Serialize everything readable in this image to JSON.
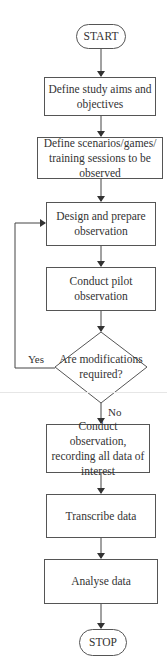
{
  "flowchart": {
    "start": "START",
    "steps": [
      "Define study aims and objectives",
      "Define scenarios/games/ training sessions to be observed",
      "Design and prepare observation",
      "Conduct pilot observation"
    ],
    "decision": "Are modifications required?",
    "decision_yes": "Yes",
    "decision_no": "No",
    "steps_after": [
      "Conduct observation, recording all data of interest",
      "Transcribe data",
      "Analyse data"
    ],
    "stop": "STOP"
  },
  "colors": {
    "line": "#444444",
    "border": "#555555",
    "text": "#333333"
  }
}
